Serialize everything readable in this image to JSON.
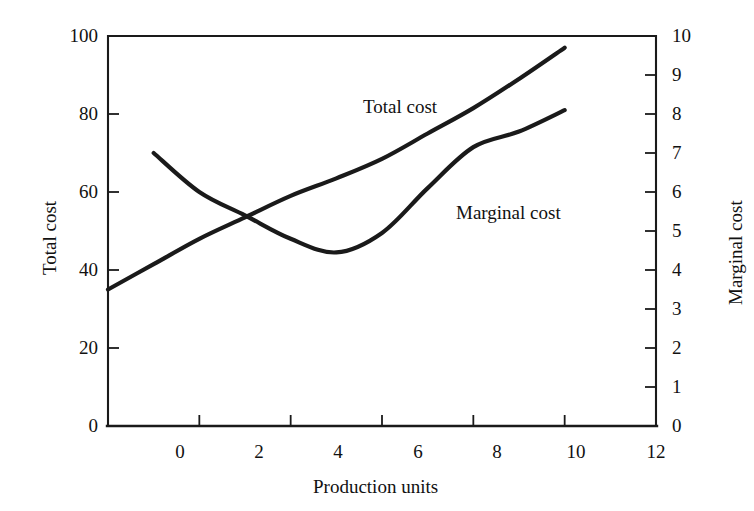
{
  "chart_data": {
    "type": "line",
    "title": "",
    "subtitle": "",
    "xlabel": "Production units",
    "ylabel": "Total cost",
    "y2label": "Marginal cost",
    "xlim": [
      0,
      12
    ],
    "ylim": [
      0,
      100
    ],
    "y2lim": [
      0,
      10
    ],
    "grid": false,
    "legend_position": "inline-annotations",
    "xticks": [
      "0",
      "2",
      "4",
      "6",
      "8",
      "10",
      "12"
    ],
    "xtick_values": [
      0,
      2,
      4,
      6,
      8,
      10,
      12
    ],
    "yticks": [
      "0",
      "20",
      "40",
      "60",
      "80",
      "100"
    ],
    "ytick_values": [
      0,
      20,
      40,
      60,
      80,
      100
    ],
    "y2ticks": [
      "0",
      "1",
      "2",
      "3",
      "4",
      "5",
      "6",
      "7",
      "8",
      "9",
      "10"
    ],
    "y2tick_values": [
      0,
      1,
      2,
      3,
      4,
      5,
      6,
      7,
      8,
      9,
      10
    ],
    "annotations": [
      {
        "text": "Total cost",
        "x": 4.6,
        "y": 82
      },
      {
        "text": "Marginal cost",
        "x": 7.1,
        "y": 51
      }
    ],
    "series": [
      {
        "name": "Total cost",
        "axis": "left",
        "color": "#1a1a1a",
        "x": [
          0,
          1,
          2,
          3,
          4,
          5,
          6,
          7,
          8,
          9,
          10
        ],
        "values": [
          35.0,
          41.5,
          48.0,
          53.5,
          59.0,
          63.5,
          68.5,
          75.0,
          81.5,
          89.0,
          97.0
        ]
      },
      {
        "name": "Marginal cost",
        "axis": "right",
        "color": "#1a1a1a",
        "x": [
          1,
          2,
          3,
          4,
          5,
          6,
          7,
          8,
          9,
          10
        ],
        "values": [
          7.0,
          6.0,
          5.4,
          4.8,
          4.45,
          4.95,
          6.1,
          7.15,
          7.55,
          8.1
        ]
      }
    ]
  },
  "axes": {
    "x_title": "Production units",
    "y_left_title": "Total cost",
    "y_right_title": "Marginal cost"
  },
  "labels": {
    "total_cost": "Total cost",
    "marginal_cost": "Marginal cost"
  },
  "colors": {
    "background": "#ffffff",
    "axis": "#1a1a1a",
    "curve": "#1a1a1a",
    "text": "#111111"
  }
}
